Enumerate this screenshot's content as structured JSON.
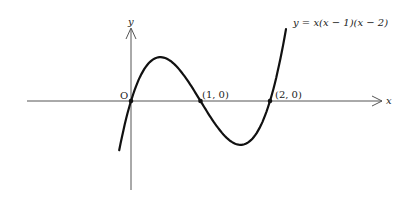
{
  "chart_data": {
    "type": "line",
    "title": "",
    "function": "y = x(x − 1)(x − 2)",
    "xlabel": "x",
    "ylabel": "y",
    "origin_label": "O",
    "points": [
      {
        "label": "(1, 0)",
        "x": 1,
        "y": 0
      },
      {
        "label": "(2, 0)",
        "x": 2,
        "y": 0
      }
    ],
    "series": [
      {
        "name": "y = x(x − 1)(x − 2)",
        "x": [
          -0.17,
          0,
          0.2,
          0.42,
          0.6,
          0.8,
          1,
          1.2,
          1.42,
          1.58,
          1.8,
          2,
          2.1,
          2.23
        ],
        "values": [
          -0.39,
          0,
          0.29,
          0.385,
          0.34,
          0.19,
          0,
          -0.19,
          -0.34,
          -0.385,
          -0.29,
          0,
          0.23,
          0.63
        ]
      }
    ],
    "xlim": [
      -1.5,
      3.6
    ],
    "ylim": [
      -0.8,
      0.65
    ],
    "grid": false,
    "legend": "none"
  },
  "labels": {
    "equation": "y = x(x − 1)(x − 2)",
    "x_axis": "x",
    "y_axis": "y",
    "origin": "O",
    "point1": "(1, 0)",
    "point2": "(2, 0)"
  }
}
